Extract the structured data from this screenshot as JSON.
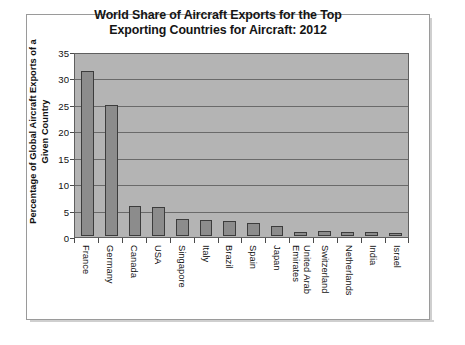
{
  "figure": {
    "title_line1": "World Share of Aircraft Exports for the Top",
    "title_line2": "Exporting Countries for Aircraft: 2012",
    "y_axis_title_line1": "Percentage of Global Aircraft Exports of a",
    "y_axis_title_line2": "Given Country",
    "plot_background": "#b4b4b4",
    "bar_fill": "#8c8c8c",
    "bar_border": "#3c3c3c",
    "frame_border": "#9a9a9a"
  },
  "chart_data": {
    "type": "bar",
    "title": "World Share of Aircraft Exports for the Top Exporting Countries for Aircraft: 2012",
    "xlabel": "",
    "ylabel": "Percentage of Global Aircraft Exports of a Given Country",
    "ylim": [
      0,
      35
    ],
    "yticks": [
      0,
      5,
      10,
      15,
      20,
      25,
      30,
      35
    ],
    "grid": true,
    "legend": false,
    "categories": [
      "France",
      "Germany",
      "Canada",
      "USA",
      "Singapore",
      "Italy",
      "Brazil",
      "Spain",
      "Japan",
      "United Arab Emirates",
      "Switzerland",
      "Netherlands",
      "India",
      "Israel"
    ],
    "category_labels": [
      [
        "France",
        ""
      ],
      [
        "Germany",
        ""
      ],
      [
        "Canada",
        ""
      ],
      [
        "USA",
        ""
      ],
      [
        "Singapore",
        ""
      ],
      [
        "Italy",
        ""
      ],
      [
        "Brazil",
        ""
      ],
      [
        "Spain",
        ""
      ],
      [
        "Japan",
        ""
      ],
      [
        "United Arab",
        "Emirates"
      ],
      [
        "Switzerland",
        ""
      ],
      [
        "Netherlands",
        ""
      ],
      [
        "India",
        ""
      ],
      [
        "Israel",
        ""
      ]
    ],
    "values": [
      31.5,
      25.0,
      5.7,
      5.6,
      3.2,
      3.0,
      2.8,
      2.4,
      2.0,
      0.8,
      0.9,
      0.7,
      0.7,
      0.6
    ]
  }
}
